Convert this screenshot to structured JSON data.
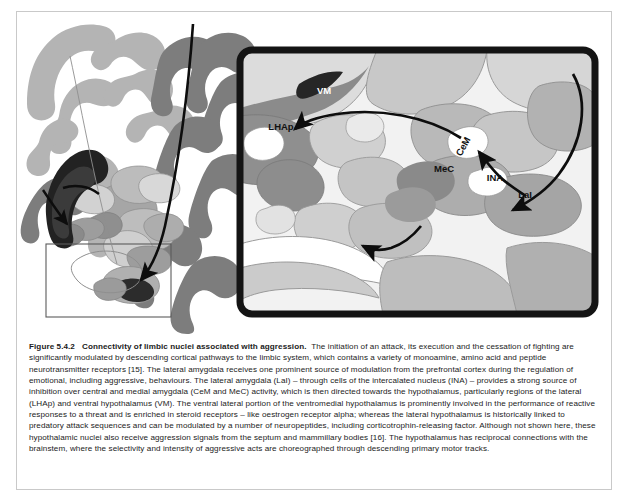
{
  "figure": {
    "id": "figure-5-4-2",
    "caption": {
      "label": "Figure 5.4.2",
      "title": "Connectivity of limbic nuclei associated with aggression.",
      "body": "The initiation of an attack, its execution and the cessation of fighting are significantly modulated by descending cortical pathways to the limbic system, which contains a variety of monoamine, amino acid and peptide neurotransmitter receptors [15]. The lateral amygdala receives one prominent source of modulation from the prefrontal cortex during the regulation of emotional, including aggressive, behaviours. The lateral amygdala (LaI) – through cells of the intercalated nucleus (INA) – provides a strong source of inhibition over central and medial amygdala (CeM and MeC) activity, which is then directed towards the hypothalamus, particularly regions of the lateral (LHAp) and ventral hypothalamus (VM). The ventral lateral portion of the ventromedial hypothalamus is prominently involved in the performance of reactive responses to a threat and is enriched in steroid receptors – like oestrogen receptor alpha; whereas the lateral hypothalamus is historically linked to predatory attack sequences and can be modulated by a number of neuropeptides, including corticotrophin-releasing factor. Although not shown here, these hypothalamic nuclei also receive aggression signals from the septum and mammillary bodies [16]. The hypothalamus has reciprocal connections with the brainstem, where the selectivity and intensity of aggressive acts are choreographed through descending primary motor tracks."
    },
    "panels": {
      "overview": {
        "name": "coronal-brain-section",
        "description": "Coronal section of the human brain rendered in grey tones showing cortical ribbon, white matter, basal ganglia, thalamus, hippocampus and amygdala",
        "selection_box": {
          "label": "",
          "description": "thin rectangle marking the amygdala-hypothalamus region magnified in the inset"
        }
      },
      "inset": {
        "name": "magnified-limbic-inset",
        "description": "Magnified view of the amygdala and hypothalamic nuclei with connectivity arrows",
        "border_color": "#141414"
      }
    },
    "labels": [
      {
        "key": "vm",
        "text": "VM",
        "full_name": "ventral hypothalamus",
        "color": "#ffffff",
        "x": 307,
        "y": 79,
        "rotation": 0
      },
      {
        "key": "lhap",
        "text": "LHAp",
        "full_name": "lateral hypothalamus",
        "color": "#111111",
        "x": 264,
        "y": 115,
        "rotation": 0
      },
      {
        "key": "cem",
        "text": "CeM",
        "full_name": "central amygdala",
        "color": "#111111",
        "x": 448,
        "y": 133,
        "rotation": -62
      },
      {
        "key": "mec",
        "text": "MeC",
        "full_name": "medial amygdala",
        "color": "#111111",
        "x": 426,
        "y": 157,
        "rotation": 0
      },
      {
        "key": "ina",
        "text": "INA",
        "full_name": "intercalated nucleus",
        "color": "#111111",
        "x": 477,
        "y": 166,
        "rotation": 0
      },
      {
        "key": "lai",
        "text": "LaI",
        "full_name": "lateral amygdala",
        "color": "#111111",
        "x": 507,
        "y": 183,
        "rotation": 0
      }
    ],
    "arrows": [
      {
        "key": "cortex-to-amygdala",
        "description": "long curved arrow from cortex on the overview section into the boxed amygdala region"
      },
      {
        "key": "prefrontal-to-lai",
        "description": "curved arrow descending from upper right of the inset to the lateral amygdala"
      },
      {
        "key": "lai-to-ina-cem",
        "description": "arrow from LaI up to the intercalated nucleus and central amygdala"
      },
      {
        "key": "cem-to-lhap",
        "description": "long arrow from CeM across to the lateral hypothalamus"
      },
      {
        "key": "descending-brainstem",
        "description": "short arrow descending towards the brainstem at the base of the inset"
      }
    ],
    "palette": {
      "background": "#ffffff",
      "cortex_light": "#b7b7b7",
      "cortex_mid": "#9a9a9a",
      "cortex_dark": "#7b7b7b",
      "nucleus_dark": "#2e2e2e",
      "nucleus_darkest": "#1a1a1a",
      "tissue_pale": "#d4d4d4",
      "tissue_paler": "#e6e6e6",
      "outline": "#8a8a8a",
      "arrow": "#0d0d0d",
      "frame": "#c9c9c9"
    }
  }
}
